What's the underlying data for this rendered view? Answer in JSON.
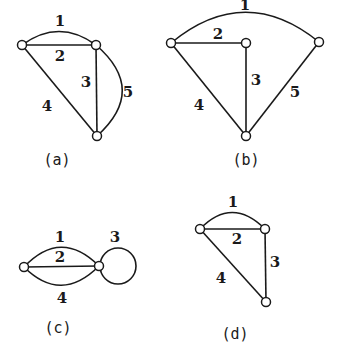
{
  "figures": [
    {
      "id": "a",
      "caption": "(a)",
      "nodes": [
        {
          "id": "a1",
          "x": 22,
          "y": 45
        },
        {
          "id": "a2",
          "x": 96,
          "y": 45
        },
        {
          "id": "a3",
          "x": 97,
          "y": 136
        }
      ],
      "edges": [
        {
          "label": "1",
          "from": "a1",
          "to": "a2",
          "shape": "arc-up"
        },
        {
          "label": "2",
          "from": "a1",
          "to": "a2",
          "shape": "straight"
        },
        {
          "label": "3",
          "from": "a2",
          "to": "a3",
          "shape": "straight"
        },
        {
          "label": "4",
          "from": "a1",
          "to": "a3",
          "shape": "straight"
        },
        {
          "label": "5",
          "from": "a2",
          "to": "a3",
          "shape": "arc-right"
        }
      ]
    },
    {
      "id": "b",
      "caption": "(b)",
      "nodes": [
        {
          "id": "b1",
          "x": 171,
          "y": 43
        },
        {
          "id": "b2",
          "x": 246,
          "y": 43
        },
        {
          "id": "b3",
          "x": 319,
          "y": 42
        },
        {
          "id": "b4",
          "x": 246,
          "y": 136
        }
      ],
      "edges": [
        {
          "label": "1",
          "from": "b1",
          "to": "b3",
          "shape": "arc-up"
        },
        {
          "label": "2",
          "from": "b1",
          "to": "b2",
          "shape": "straight"
        },
        {
          "label": "3",
          "from": "b2",
          "to": "b4",
          "shape": "straight"
        },
        {
          "label": "4",
          "from": "b1",
          "to": "b4",
          "shape": "straight"
        },
        {
          "label": "5",
          "from": "b3",
          "to": "b4",
          "shape": "straight"
        }
      ]
    },
    {
      "id": "c",
      "caption": "(c)",
      "nodes": [
        {
          "id": "c1",
          "x": 24,
          "y": 267
        },
        {
          "id": "c2",
          "x": 99,
          "y": 266
        }
      ],
      "edges": [
        {
          "label": "1",
          "from": "c1",
          "to": "c2",
          "shape": "arc-up"
        },
        {
          "label": "2",
          "from": "c1",
          "to": "c2",
          "shape": "straight"
        },
        {
          "label": "3",
          "from": "c2",
          "to": "c2",
          "shape": "self-loop"
        },
        {
          "label": "4",
          "from": "c1",
          "to": "c2",
          "shape": "arc-down"
        }
      ]
    },
    {
      "id": "d",
      "caption": "(d)",
      "nodes": [
        {
          "id": "d1",
          "x": 200,
          "y": 229
        },
        {
          "id": "d2",
          "x": 265,
          "y": 229
        },
        {
          "id": "d3",
          "x": 266,
          "y": 302
        }
      ],
      "edges": [
        {
          "label": "1",
          "from": "d1",
          "to": "d2",
          "shape": "arc-up"
        },
        {
          "label": "2",
          "from": "d1",
          "to": "d2",
          "shape": "straight"
        },
        {
          "label": "3",
          "from": "d2",
          "to": "d3",
          "shape": "straight"
        },
        {
          "label": "4",
          "from": "d1",
          "to": "d3",
          "shape": "straight"
        }
      ]
    }
  ],
  "labels": {
    "a": {
      "e1": "1",
      "e2": "2",
      "e3": "3",
      "e4": "4",
      "e5": "5",
      "caption": "(a)"
    },
    "b": {
      "e1": "1",
      "e2": "2",
      "e3": "3",
      "e4": "4",
      "e5": "5",
      "caption": "(b)"
    },
    "c": {
      "e1": "1",
      "e2": "2",
      "e3": "3",
      "e4": "4",
      "caption": "(c)"
    },
    "d": {
      "e1": "1",
      "e2": "2",
      "e3": "3",
      "e4": "4",
      "caption": "(d)"
    }
  },
  "colors": {
    "stroke": "#1a1a1a",
    "background": "#ffffff"
  }
}
